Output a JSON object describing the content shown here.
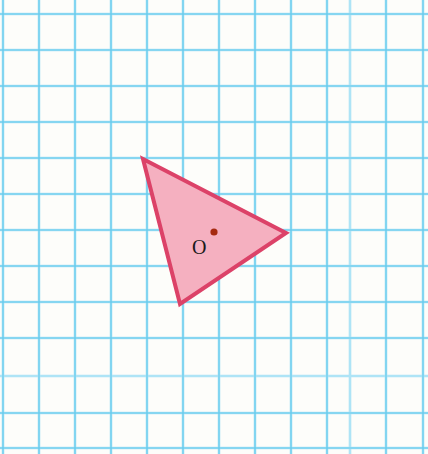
{
  "figure": {
    "title_fragment": "g",
    "paper_color": "#fdfdfa",
    "width": 428,
    "height": 454,
    "grid": {
      "major_color": "#5fc8ec",
      "minor_color": "#aee4f6",
      "cell_size": 36,
      "vertical_lines": [
        3,
        39,
        75,
        111,
        147,
        183,
        219,
        255,
        291,
        327,
        350,
        386,
        423
      ],
      "horizontal_lines": [
        14,
        50,
        86,
        122,
        158,
        194,
        230,
        266,
        302,
        338,
        376,
        413,
        448
      ],
      "major_vertical_lines": [
        3,
        39,
        75,
        111,
        147,
        183,
        219,
        255,
        291,
        327,
        386,
        423
      ],
      "major_horizontal_lines": [
        14,
        50,
        86,
        122,
        158,
        194,
        230,
        266,
        302,
        338,
        413,
        448
      ]
    },
    "shape": {
      "name": "triangle",
      "fill_color": "#f5b0c0",
      "stroke_color": "#dc4268",
      "stroke_width": 4,
      "points": "143,159 286,233 180,304",
      "vertices": [
        {
          "label": "",
          "x": 143,
          "y": 159
        },
        {
          "label": "",
          "x": 286,
          "y": 233
        },
        {
          "label": "",
          "x": 180,
          "y": 304
        }
      ]
    },
    "center_point": {
      "label": "O",
      "x": 214,
      "y": 232,
      "radius": 3.6,
      "color": "#a52a10",
      "label_x": 192,
      "label_y": 237
    }
  }
}
